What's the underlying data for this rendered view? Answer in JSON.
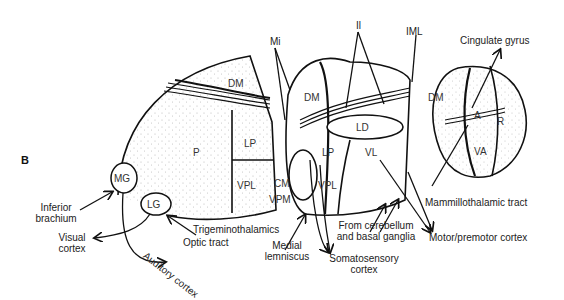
{
  "figure": {
    "panel_label": "B",
    "nuclei": {
      "left_block": {
        "dm": "DM",
        "p": "P",
        "lp": "LP",
        "vpl": "VPL",
        "mg": "MG",
        "lg": "LG"
      },
      "middle_block": {
        "dm": "DM",
        "ld": "LD",
        "lp": "LP",
        "vl": "VL",
        "vpl": "VPL",
        "cm": "CM",
        "vpm": "VPM"
      },
      "right_block": {
        "dm": "DM",
        "a": "A",
        "r": "R",
        "va": "VA"
      }
    },
    "annotations": {
      "mi": "Mi",
      "il": "Il",
      "iml": "IML",
      "cingulate_gyrus": "Cingulate gyrus",
      "mammillothalamic_tract": "Mammillothalamic tract",
      "inferior_brachium": [
        "Inferior",
        "brachium"
      ],
      "visual_cortex": [
        "Visual",
        "cortex"
      ],
      "auditory_cortex": "Auditory cortex",
      "optic_tract": "Optic tract",
      "trigeminothalamics": "Trigeminothalamics",
      "medial_lemniscus": [
        "Medial",
        "lemniscus"
      ],
      "somatosensory_cortex": [
        "Somatosensory",
        "cortex"
      ],
      "from_cerebellum": [
        "From cerebellum",
        "and basal ganglia"
      ],
      "motor_premotor_cortex": "Motor/premotor cortex"
    }
  }
}
